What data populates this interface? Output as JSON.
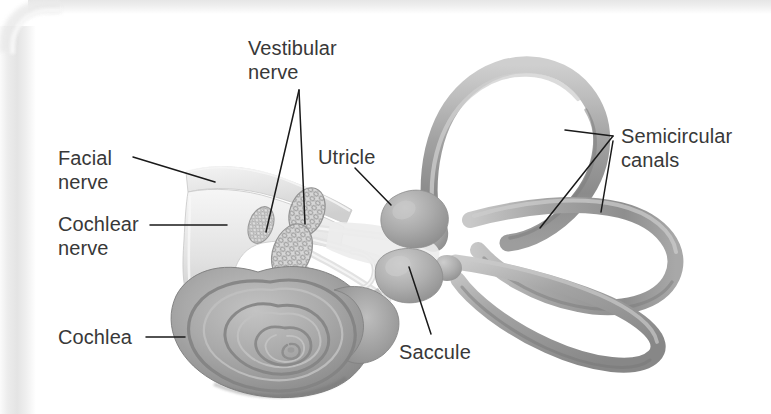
{
  "figure": {
    "kind": "anatomical-illustration",
    "style": "grayscale airbrushed textbook halftone scan",
    "background_color": "#ffffff",
    "label_text_color": "#383838",
    "leader_line_color": "#1a1a1a"
  },
  "labels": [
    {
      "id": "vestibular-nerve",
      "text": "Vestibular\nnerve",
      "x": 248,
      "y": 36,
      "align": "left"
    },
    {
      "id": "utricle",
      "text": "Utricle",
      "x": 318,
      "y": 146,
      "align": "left"
    },
    {
      "id": "semicircular-canals",
      "text": "Semicircular\ncanals",
      "x": 621,
      "y": 124,
      "align": "left"
    },
    {
      "id": "facial-nerve",
      "text": "Facial\nnerve",
      "x": 58,
      "y": 146,
      "align": "left"
    },
    {
      "id": "cochlear-nerve",
      "text": "Cochlear\nnerve",
      "x": 58,
      "y": 212,
      "align": "left"
    },
    {
      "id": "cochlea",
      "text": "Cochlea",
      "x": 58,
      "y": 326,
      "align": "left"
    },
    {
      "id": "saccule",
      "text": "Saccule",
      "x": 399,
      "y": 341,
      "align": "left"
    }
  ],
  "structures": [
    {
      "id": "cochlea",
      "name": "Cochlea",
      "description": "spiral snail-shell shaped coil, lower left"
    },
    {
      "id": "cochlear-nerve",
      "name": "Cochlear nerve",
      "description": "pale nerve trunk entering the cochlea"
    },
    {
      "id": "facial-nerve",
      "name": "Facial nerve",
      "description": "pale upper nerve branch of the trunk"
    },
    {
      "id": "vestibular-nerve",
      "name": "Vestibular nerve",
      "description": "two mesh-textured nerve cross-sections"
    },
    {
      "id": "utricle",
      "name": "Utricle",
      "description": "upper sac of the vestibule"
    },
    {
      "id": "saccule",
      "name": "Saccule",
      "description": "lower rounded sac of the vestibule"
    },
    {
      "id": "semicircular-canals",
      "name": "Semicircular canals",
      "description": "three looping tubes: superior, posterior, lateral"
    }
  ],
  "leader_lines": [
    {
      "for": "facial-nerve",
      "path": "M 133 157 L 215 182"
    },
    {
      "for": "cochlear-nerve",
      "path": "M 150 225 L 227 225"
    },
    {
      "for": "cochlea",
      "path": "M 146 337 L 185 337"
    },
    {
      "for": "vestibular-nerve",
      "path": "M 299 90 L 266 232"
    },
    {
      "for": "vestibular-nerve",
      "path": "M 299 90 L 305 224"
    },
    {
      "for": "utricle",
      "path": "M 355 168 L 391 205"
    },
    {
      "for": "saccule",
      "path": "M 431 334 L 409 267"
    },
    {
      "for": "semicircular-canals",
      "path": "M 613 136 L 565 130"
    },
    {
      "for": "semicircular-canals",
      "path": "M 613 136 L 540 228"
    },
    {
      "for": "semicircular-canals",
      "path": "M 613 141 L 601 212"
    }
  ]
}
